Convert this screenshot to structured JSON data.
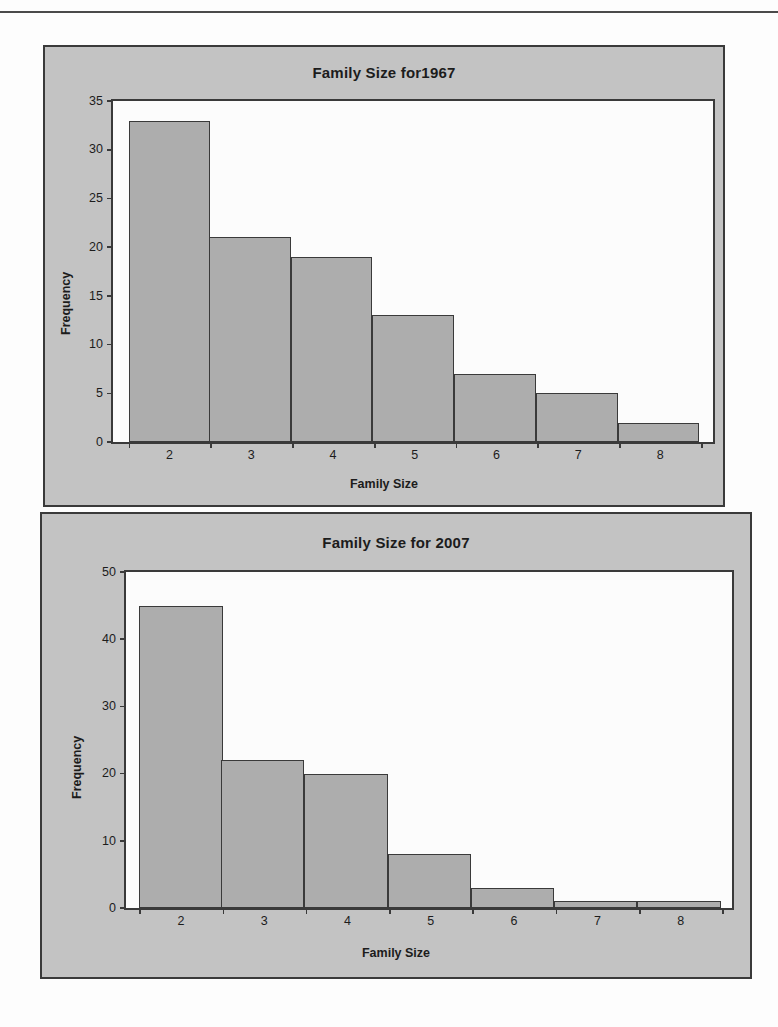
{
  "page": {
    "rule_color": "#4a4a4a",
    "panel_background": "#c3c3c3",
    "plot_background": "#fcfcfc",
    "bar_fill": "#adadad",
    "outline_color": "#3a3a3a"
  },
  "chart_data": [
    {
      "id": "family-size-1967",
      "type": "bar",
      "title": "Family Size for1967",
      "xlabel": "Family Size",
      "ylabel": "Frequency",
      "categories": [
        "2",
        "3",
        "4",
        "5",
        "6",
        "7",
        "8"
      ],
      "values": [
        33,
        21,
        19,
        13,
        7,
        5,
        2
      ],
      "yticks": [
        "0",
        "5",
        "10",
        "15",
        "20",
        "25",
        "30",
        "35"
      ],
      "ytick_values": [
        0,
        5,
        10,
        15,
        20,
        25,
        30,
        35
      ],
      "ylim": [
        0,
        35
      ],
      "xticks": [
        "2",
        "3",
        "4",
        "5",
        "6",
        "7",
        "8"
      ],
      "grid": false,
      "legend": false
    },
    {
      "id": "family-size-2007",
      "type": "bar",
      "title": "Family Size for 2007",
      "xlabel": "Family Size",
      "ylabel": "Frequency",
      "categories": [
        "2",
        "3",
        "4",
        "5",
        "6",
        "7",
        "8"
      ],
      "values": [
        45,
        22,
        20,
        8,
        3,
        1,
        1
      ],
      "yticks": [
        "0",
        "10",
        "20",
        "30",
        "40",
        "50"
      ],
      "ytick_values": [
        0,
        10,
        20,
        30,
        40,
        50
      ],
      "ylim": [
        0,
        50
      ],
      "xticks": [
        "2",
        "3",
        "4",
        "5",
        "6",
        "7",
        "8"
      ],
      "grid": false,
      "legend": false
    }
  ]
}
